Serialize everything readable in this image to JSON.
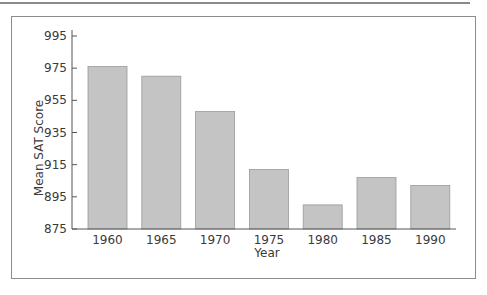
{
  "chart_data": {
    "type": "bar",
    "title": "",
    "xlabel": "Year",
    "ylabel": "Mean SAT Score",
    "categories": [
      "1960",
      "1965",
      "1970",
      "1975",
      "1980",
      "1985",
      "1990"
    ],
    "values": [
      976,
      970,
      948,
      912,
      890,
      907,
      902
    ],
    "ylim": [
      875,
      995
    ],
    "yticks": [
      875,
      895,
      915,
      935,
      955,
      975,
      995
    ],
    "grid": false,
    "legend": null,
    "bar_color": "#c4c4c4",
    "bar_edge_color": "#9a9a9a"
  }
}
